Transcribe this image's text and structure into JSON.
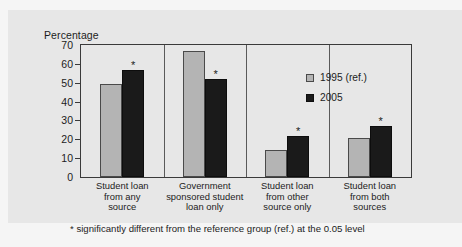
{
  "chart_data": {
    "type": "bar",
    "title": "",
    "ylabel": "Percentage",
    "xlabel": "",
    "ylim": [
      0,
      70
    ],
    "yticks": [
      0,
      10,
      20,
      30,
      40,
      50,
      60,
      70
    ],
    "grid": false,
    "legend_position": "right-inside",
    "categories": [
      "Student loan from any source",
      "Government sponsored student loan only",
      "Student loan from other source only",
      "Student loan from both sources"
    ],
    "category_lines": [
      [
        "Student loan",
        "from any",
        "source"
      ],
      [
        "Government",
        "sponsored student",
        "loan only"
      ],
      [
        "Student loan",
        "from other",
        "source only"
      ],
      [
        "Student loan",
        "from both",
        "sources"
      ]
    ],
    "series": [
      {
        "name": "1995 (ref.)",
        "color": "#b4b4b4",
        "values": [
          49.5,
          67,
          14.5,
          20.5
        ],
        "significance": [
          "",
          "",
          "",
          ""
        ]
      },
      {
        "name": "2005",
        "color": "#1a1a1a",
        "values": [
          57,
          52,
          22,
          27
        ],
        "significance": [
          "*",
          "*",
          "*",
          "*"
        ]
      }
    ],
    "annotations": {
      "significance_marker": "*",
      "footnote": "* significantly different from the reference group (ref.) at the 0.05 level"
    }
  },
  "legend": {
    "items": [
      {
        "label": "1995 (ref.)",
        "swatch": "legend-swatch-1995"
      },
      {
        "label": "2005",
        "swatch": "legend-swatch-2005"
      }
    ]
  },
  "colors": {
    "panel_background": "#e7e7e7",
    "page_background": "#f5f5f5",
    "axis": "#3a3a3a",
    "series_1995": "#b4b4b4",
    "series_2005": "#1a1a1a",
    "text": "#1c1c1c"
  }
}
